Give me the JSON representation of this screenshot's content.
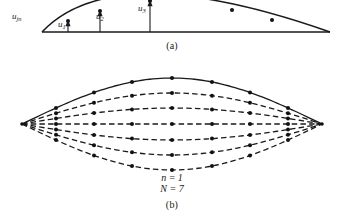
{
  "figure": {
    "width": 344,
    "height": 219,
    "background_color": "#ffffff",
    "stroke_color": "#1a1a1a",
    "node_color": "#111111"
  },
  "panel_a": {
    "caption": "(a)",
    "description": "Deflected chord of a single element showing nodal displacements above a straight baseline",
    "baseline": {
      "x1": 42,
      "y1": 32,
      "x2": 330,
      "y2": 32
    },
    "arc": {
      "type": "parabolic-arc",
      "left_end": [
        42,
        32
      ],
      "apex": [
        150,
        -6
      ],
      "right_end": [
        330,
        32
      ],
      "line_style": "solid"
    },
    "nodes_on_arc": [
      [
        68,
        21
      ],
      [
        100,
        11
      ],
      [
        150,
        1
      ],
      [
        232,
        10
      ],
      [
        272,
        20
      ]
    ],
    "arrows": [
      {
        "name": "u1",
        "label": "u",
        "subscript": "1",
        "x": 68,
        "base_y": 32,
        "tip_y": 21
      },
      {
        "name": "u2",
        "label": "u",
        "subscript": "2",
        "x": 100,
        "base_y": 32,
        "tip_y": 11
      },
      {
        "name": "u3",
        "label": "u",
        "subscript": "3",
        "x": 150,
        "base_y": 32,
        "tip_y": 1
      }
    ],
    "labels": {
      "u_jn": {
        "text": "u",
        "subscript": "jn"
      },
      "u_1": {
        "text": "u",
        "subscript": "1"
      },
      "u_2": {
        "text": "u",
        "subscript": "2"
      },
      "u_3": {
        "text": "u",
        "subscript": "3"
      }
    }
  },
  "panel_b": {
    "caption": "(b)",
    "description": "Family of seven mode-shape curves spanning between two pinned end vertices, forming a lens/eye shape",
    "parameters": [
      {
        "symbol": "n",
        "value": "1",
        "text": "n = 1"
      },
      {
        "symbol": "N",
        "value": "7",
        "text": "N = 7"
      }
    ],
    "left_vertex": [
      22,
      124
    ],
    "right_vertex": [
      322,
      124
    ],
    "curve_count": 7,
    "nodes_per_curve": 7,
    "node_x_positions": [
      56,
      94,
      132,
      172,
      212,
      250,
      288
    ],
    "curves": [
      {
        "index": 1,
        "amplitude": -46,
        "line_style": "solid",
        "peak_y": 78
      },
      {
        "index": 2,
        "amplitude": -31,
        "line_style": "dashed",
        "peak_y": 93
      },
      {
        "index": 3,
        "amplitude": -16,
        "line_style": "dashed",
        "peak_y": 108
      },
      {
        "index": 4,
        "amplitude": 0,
        "line_style": "dashed",
        "peak_y": 124
      },
      {
        "index": 5,
        "amplitude": 16,
        "line_style": "dashed",
        "peak_y": 140
      },
      {
        "index": 6,
        "amplitude": 31,
        "line_style": "dashed",
        "peak_y": 155
      },
      {
        "index": 7,
        "amplitude": 46,
        "line_style": "dashed",
        "peak_y": 170
      }
    ]
  },
  "chart_data": {
    "type": "line",
    "title": "",
    "xlabel": "",
    "ylabel": "",
    "grid": false,
    "legend_position": "none",
    "subplots": [
      {
        "id": "a",
        "caption": "(a)",
        "type": "line",
        "annotations": [
          "u_jn",
          "u_1",
          "u_2",
          "u_3"
        ],
        "x": [
          42,
          68,
          100,
          150,
          232,
          272,
          330
        ],
        "series": [
          {
            "name": "deflected-chord",
            "values": [
              32,
              21,
              11,
              1,
              10,
              20,
              32
            ],
            "style": "solid"
          },
          {
            "name": "baseline",
            "values": [
              32,
              32,
              32,
              32,
              32,
              32,
              32
            ],
            "style": "solid"
          }
        ]
      },
      {
        "id": "b",
        "caption": "(b)",
        "type": "line",
        "annotations": [
          "n = 1",
          "N = 7"
        ],
        "x": [
          22,
          56,
          94,
          132,
          172,
          212,
          250,
          288,
          322
        ],
        "series": [
          {
            "name": "curve-1",
            "values": [
              124,
              92,
              82,
              78,
              78,
              78,
              82,
              92,
              124
            ],
            "style": "solid",
            "amplitude": -46
          },
          {
            "name": "curve-2",
            "values": [
              124,
              103,
              96,
              93,
              93,
              93,
              96,
              103,
              124
            ],
            "style": "dashed",
            "amplitude": -31
          },
          {
            "name": "curve-3",
            "values": [
              124,
              114,
              110,
              108,
              108,
              108,
              110,
              114,
              124
            ],
            "style": "dashed",
            "amplitude": -16
          },
          {
            "name": "curve-4",
            "values": [
              124,
              124,
              124,
              124,
              124,
              124,
              124,
              124,
              124
            ],
            "style": "dashed",
            "amplitude": 0
          },
          {
            "name": "curve-5",
            "values": [
              124,
              134,
              138,
              140,
              140,
              140,
              138,
              134,
              124
            ],
            "style": "dashed",
            "amplitude": 16
          },
          {
            "name": "curve-6",
            "values": [
              124,
              145,
              152,
              155,
              155,
              155,
              152,
              145,
              124
            ],
            "style": "dashed",
            "amplitude": 31
          },
          {
            "name": "curve-7",
            "values": [
              124,
              156,
              166,
              170,
              170,
              170,
              166,
              156,
              124
            ],
            "style": "dashed",
            "amplitude": 46
          }
        ]
      }
    ]
  }
}
